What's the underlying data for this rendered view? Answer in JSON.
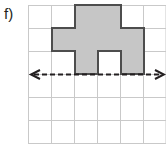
{
  "label": {
    "text": "f)"
  },
  "colors": {
    "grid_line": "#c9c9c9",
    "shape_fill": "#c6c6c6",
    "shape_stroke": "#4d4d4d",
    "arrow": "#231f20",
    "background": "#ffffff",
    "label_text": "#231f20"
  },
  "grid": {
    "origin_x": 28,
    "origin_y": 5,
    "cell": 23,
    "cols": 6,
    "rows": 6,
    "line_width": 1
  },
  "shape": {
    "name": "shaded-plus-figure",
    "description": "Shaded cross/plus shaped polygon on grid with a square notch cut from the bottom center",
    "cells_filled": 9,
    "outline_cells": [
      [
        2,
        0
      ],
      [
        1,
        1
      ],
      [
        2,
        1
      ],
      [
        3,
        1
      ],
      [
        4,
        1
      ],
      [
        1,
        2
      ],
      [
        2,
        2
      ],
      [
        4,
        2
      ]
    ],
    "polygon_points": "75,5 121,5 121,28 144,28 144,74 121,74 121,51 98,51 98,74 75,74 75,51 52,51 52,28 75,28",
    "stroke_width": 2
  },
  "arrow": {
    "name": "dashed-width-arrow",
    "y": 74,
    "x_start": 32,
    "x_end": 162,
    "dash_pattern": "5,3",
    "stroke_width": 2,
    "double_headed": true,
    "head_size": 7
  }
}
